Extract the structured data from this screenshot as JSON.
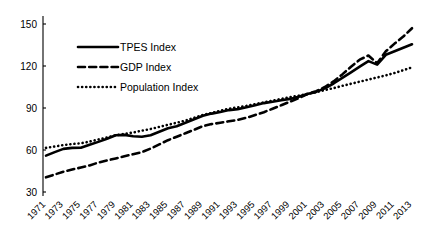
{
  "chart_data": {
    "type": "line",
    "title": "",
    "subtitle": "",
    "xlabel": "",
    "ylabel": "",
    "xlim": [
      1971,
      2013
    ],
    "ylim": [
      30,
      160
    ],
    "grid": false,
    "legend_position": "top-left",
    "base_year": 2001,
    "base_value": 100,
    "y_ticks": [
      "150",
      "120",
      "90",
      "60",
      "30"
    ],
    "y_tick_values": [
      150,
      120,
      90,
      60,
      30
    ],
    "x_tick_labels": [
      "1971",
      "1973",
      "1975",
      "1977",
      "1979",
      "1981",
      "1983",
      "1985",
      "1987",
      "1989",
      "1991",
      "1993",
      "1995",
      "1997",
      "1999",
      "2001",
      "2003",
      "2005",
      "2007",
      "2009",
      "2011",
      "2013"
    ],
    "x": [
      1971,
      1972,
      1973,
      1974,
      1975,
      1976,
      1977,
      1978,
      1979,
      1980,
      1981,
      1982,
      1983,
      1984,
      1985,
      1986,
      1987,
      1988,
      1989,
      1990,
      1991,
      1992,
      1993,
      1994,
      1995,
      1996,
      1997,
      1998,
      1999,
      2000,
      2001,
      2002,
      2003,
      2004,
      2005,
      2006,
      2007,
      2008,
      2009,
      2010,
      2011,
      2012,
      2013
    ],
    "series": [
      {
        "name": "TPES Index",
        "style": "solid",
        "color": "#000000",
        "values": [
          56.0,
          58.5,
          60.8,
          61.5,
          61.6,
          63.8,
          65.8,
          68.0,
          70.5,
          70.8,
          69.8,
          69.5,
          70.5,
          73.0,
          75.5,
          77.0,
          79.5,
          82.0,
          84.5,
          86.0,
          87.2,
          88.5,
          89.2,
          90.5,
          92.0,
          93.5,
          94.5,
          95.5,
          96.5,
          98.0,
          100.0,
          101.5,
          104.0,
          107.5,
          111.5,
          115.5,
          119.5,
          123.5,
          121.0,
          128.0,
          130.5,
          133.0,
          135.5
        ]
      },
      {
        "name": "GDP Index",
        "style": "dashed",
        "color": "#000000",
        "values": [
          40.5,
          42.5,
          44.5,
          46.0,
          47.5,
          49.0,
          51.0,
          52.5,
          54.0,
          55.5,
          57.0,
          58.5,
          61.0,
          64.0,
          67.0,
          69.5,
          72.0,
          74.5,
          77.0,
          78.5,
          79.5,
          80.5,
          81.5,
          83.0,
          85.0,
          87.0,
          89.5,
          92.0,
          94.5,
          97.0,
          100.0,
          102.0,
          105.0,
          109.0,
          114.0,
          119.5,
          124.5,
          127.5,
          122.0,
          130.5,
          136.0,
          141.0,
          147.0
        ]
      },
      {
        "name": "Population Index",
        "style": "dotted",
        "color": "#000000",
        "values": [
          61.5,
          62.5,
          63.5,
          64.3,
          64.8,
          66.0,
          67.5,
          69.0,
          70.5,
          71.5,
          72.5,
          73.8,
          75.0,
          76.5,
          78.0,
          79.5,
          81.0,
          83.0,
          85.0,
          86.5,
          88.0,
          89.5,
          90.5,
          91.5,
          92.8,
          94.0,
          95.3,
          96.5,
          97.7,
          98.8,
          100.0,
          101.3,
          102.8,
          104.2,
          105.8,
          107.3,
          108.8,
          110.3,
          111.8,
          113.3,
          115.0,
          117.0,
          119.0
        ]
      }
    ]
  },
  "legend": {
    "items": [
      {
        "label": "TPES Index",
        "style": "solid"
      },
      {
        "label": "GDP Index",
        "style": "dashed"
      },
      {
        "label": "Population Index",
        "style": "dotted"
      }
    ]
  }
}
